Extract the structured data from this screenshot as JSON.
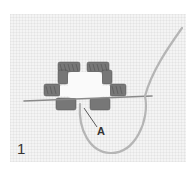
{
  "figure": {
    "number": "1",
    "callouts": [
      {
        "id": "A",
        "label": "A"
      }
    ],
    "colors": {
      "fabric": "#f4f4f4",
      "stitch_thread": "#6e6e6e",
      "working_thread": "#b0b0b0",
      "needle": "#8a8a8a"
    }
  }
}
